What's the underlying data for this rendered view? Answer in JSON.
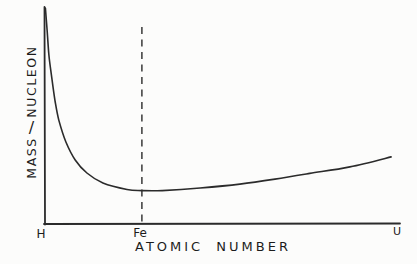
{
  "figure": {
    "background_color": "#fcfcfb",
    "ink_color": "#2b2b2b",
    "text_color": "#1c1c1c"
  },
  "y_axis": {
    "label_words": [
      "MASS",
      "/",
      "NUCLEON"
    ]
  },
  "x_axis": {
    "label": "ATOMIC NUMBER",
    "tick_labels": [
      "H",
      "Fe",
      "U"
    ]
  },
  "chart_data": {
    "type": "line",
    "title": "",
    "xlabel": "ATOMIC NUMBER",
    "ylabel": "MASS / NUCLEON",
    "x_tick_labels": [
      "H",
      "Fe",
      "U"
    ],
    "x_tick_positions_frac": [
      0.0,
      0.273,
      1.0
    ],
    "y_tick_labels": [],
    "axis_numeric_scale": "none (qualitative hand-drawn sketch, no numeric ticks)",
    "grid": false,
    "legend": null,
    "style": "hand-drawn",
    "annotations": [
      {
        "type": "vline",
        "style": "dashed",
        "label": "Fe",
        "x_frac": 0.273,
        "meaning": "minimum of mass per nucleon occurs at iron"
      }
    ],
    "series": [
      {
        "name": "mass-per-nucleon-curve",
        "description": "Maximum at H, falls steeply to a minimum near Fe, then rises gently toward U",
        "points_frac": [
          [
            0.001,
            0.995
          ],
          [
            0.006,
            0.894
          ],
          [
            0.011,
            0.779
          ],
          [
            0.018,
            0.687
          ],
          [
            0.028,
            0.571
          ],
          [
            0.039,
            0.479
          ],
          [
            0.059,
            0.378
          ],
          [
            0.085,
            0.295
          ],
          [
            0.118,
            0.235
          ],
          [
            0.163,
            0.189
          ],
          [
            0.231,
            0.159
          ],
          [
            0.273,
            0.154
          ],
          [
            0.33,
            0.154
          ],
          [
            0.437,
            0.166
          ],
          [
            0.549,
            0.184
          ],
          [
            0.648,
            0.207
          ],
          [
            0.746,
            0.233
          ],
          [
            0.859,
            0.263
          ],
          [
            0.975,
            0.309
          ]
        ]
      }
    ]
  }
}
